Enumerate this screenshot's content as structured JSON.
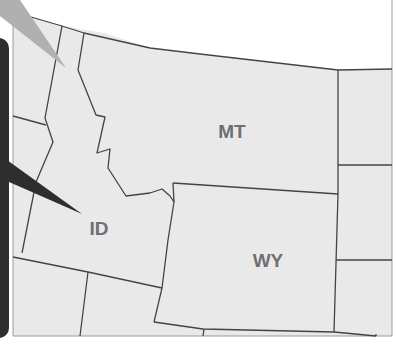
{
  "map": {
    "region": "Northwestern United States",
    "colors": {
      "land": "#e9e9e9",
      "border": "#444444",
      "label": "#6f6f6f",
      "callout_panel": "#2e2e2e",
      "background": "#ffffff"
    },
    "states": [
      {
        "abbr": "MT",
        "label_x": 232,
        "label_y": 138
      },
      {
        "abbr": "ID",
        "label_x": 99,
        "label_y": 235
      },
      {
        "abbr": "WY",
        "label_x": 268,
        "label_y": 267
      }
    ]
  },
  "callout": {
    "pointer_target": "ID"
  }
}
